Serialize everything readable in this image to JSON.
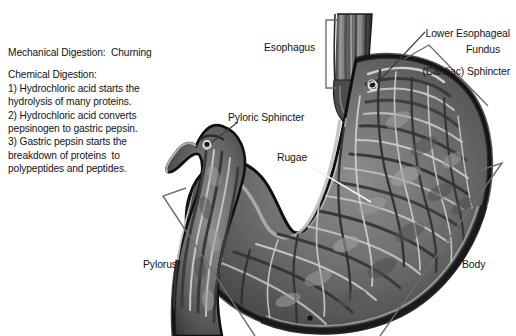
{
  "figure": {
    "background_color": "#ffffff",
    "text_color": "#141414",
    "bracket_color": "#6d6d6d"
  },
  "notes": {
    "lines": [
      "Mechanical Digestion:  Churning",
      "",
      "Chemical Digestion:",
      "1) Hydrochloric acid starts the",
      "hydrolysis of many proteins.",
      "2) Hydrochloric acid converts",
      "pepsinogen to gastric pepsin.",
      "3) Gastric pepsin starts the",
      "breakdown of proteins  to",
      "polypeptides and peptides."
    ]
  },
  "labels": {
    "lower_esophageal_sphincter_line1": "Lower Esophageal",
    "lower_esophageal_sphincter_line2": "(Cardiac) Sphincter",
    "esophagus": "Esophagus",
    "fundus": "Fundus",
    "pyloric_sphincter": "Pyloric Sphincter",
    "rugae": "Rugae",
    "pylorus": "Pylorus",
    "body": "Body"
  },
  "annotations": {
    "esophagus_marker": "square-bracket",
    "fundus_marker": "angle-bracket",
    "pylorus_marker": "angle-bracket",
    "body_marker": "angle-bracket",
    "les_marker": "leader-line-with-pin",
    "pyloric_sphincter_marker": "leader-line-with-pin",
    "rugae_marker": "white-leader-line"
  }
}
